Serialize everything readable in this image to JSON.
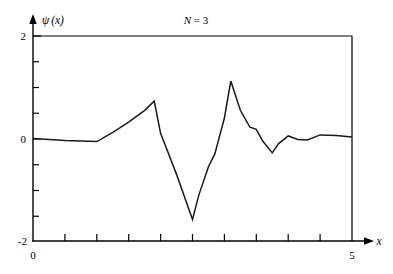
{
  "chart_data": {
    "type": "line",
    "title": "N = 3",
    "title_symbol": "N",
    "title_rest": " = 3",
    "xlabel": "x",
    "ylabel": "ψ (x)",
    "ylabel_symbol": "ψ",
    "ylabel_arg": "(x)",
    "xlim": [
      0,
      5
    ],
    "ylim": [
      -2,
      2
    ],
    "grid": false,
    "legend": null,
    "x_ticks_major": [
      0,
      5
    ],
    "x_tick_labels": [
      "0",
      "5"
    ],
    "x_minor_tick_count": 9,
    "y_ticks_major": [
      2,
      0,
      -2
    ],
    "y_tick_labels": [
      "2",
      "0",
      "-2"
    ],
    "y_minor_ticks": [
      1.5,
      1.0,
      0.5,
      -0.5,
      -1.0,
      -1.5
    ],
    "series": [
      {
        "name": "psi",
        "x": [
          0.0,
          0.25,
          0.5,
          0.75,
          1.0,
          1.25,
          1.5,
          1.75,
          1.9,
          2.0,
          2.25,
          2.5,
          2.6,
          2.75,
          2.85,
          3.0,
          3.1,
          3.25,
          3.4,
          3.5,
          3.6,
          3.75,
          3.85,
          4.0,
          4.15,
          4.3,
          4.5,
          4.75,
          5.0
        ],
        "y": [
          0.0,
          -0.02,
          -0.04,
          -0.05,
          -0.06,
          0.12,
          0.32,
          0.55,
          0.73,
          0.1,
          -0.7,
          -1.58,
          -1.1,
          -0.55,
          -0.3,
          0.4,
          1.12,
          0.55,
          0.22,
          0.18,
          -0.05,
          -0.28,
          -0.1,
          0.05,
          -0.02,
          -0.03,
          0.07,
          0.06,
          0.03
        ]
      }
    ]
  },
  "axes": {
    "x_axis_arrow": true,
    "y_axis_arrow": true,
    "frame_top_value": "2",
    "frame_right_value": "5"
  },
  "colors": {
    "curve": "#1a1a1a",
    "axis": "#000000",
    "background": "#ffffff"
  }
}
